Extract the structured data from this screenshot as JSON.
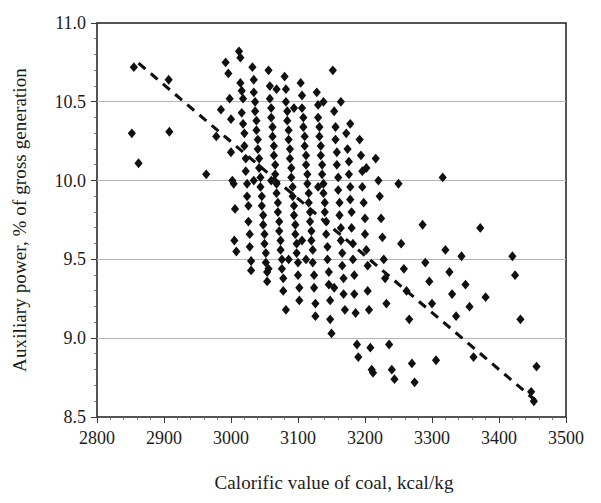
{
  "chart_data": {
    "type": "scatter",
    "title": "",
    "xlabel": "Calorific value of coal, kcal/kg",
    "ylabel": "Auxiliary power, % of gross generation",
    "xlim": [
      2800,
      3500
    ],
    "ylim": [
      8.5,
      11.0
    ],
    "xticks": [
      2800,
      2900,
      3000,
      3100,
      3200,
      3300,
      3400,
      3500
    ],
    "xtick_labels": [
      "2800",
      "2900",
      "3000",
      "3100",
      "3200",
      "3300",
      "3400",
      "3500"
    ],
    "yticks": [
      8.5,
      9.0,
      9.5,
      10.0,
      10.5,
      11.0
    ],
    "ytick_labels": [
      "8.5",
      "9.0",
      "9.5",
      "10.0",
      "10.5",
      "11.0"
    ],
    "grid": "horizontal",
    "gridline_color": "#b5b5b5",
    "legend": "none",
    "marker_shape": "diamond",
    "marker_color": "#101010",
    "marker_size_px": 7,
    "trendline": {
      "style": "dashed",
      "color": "#101010",
      "x_start": 2862,
      "y_start": 10.745,
      "x_end": 3460,
      "y_end": 8.585
    },
    "series": [
      {
        "name": "Units",
        "points": [
          [
            2855,
            10.72
          ],
          [
            2852,
            10.3
          ],
          [
            2862,
            10.11
          ],
          [
            2907,
            10.64
          ],
          [
            2908,
            10.31
          ],
          [
            2963,
            10.04
          ],
          [
            2978,
            10.28
          ],
          [
            2985,
            10.45
          ],
          [
            2992,
            10.75
          ],
          [
            2996,
            10.68
          ],
          [
            2998,
            10.52
          ],
          [
            3000,
            10.39
          ],
          [
            3000,
            10.18
          ],
          [
            3002,
            10.0
          ],
          [
            3004,
            9.98
          ],
          [
            3006,
            9.82
          ],
          [
            3005,
            9.62
          ],
          [
            3008,
            9.55
          ],
          [
            3012,
            10.82
          ],
          [
            3014,
            10.78
          ],
          [
            3014,
            10.62
          ],
          [
            3016,
            10.57
          ],
          [
            3018,
            10.52
          ],
          [
            3016,
            10.43
          ],
          [
            3018,
            10.36
          ],
          [
            3020,
            10.3
          ],
          [
            3020,
            10.22
          ],
          [
            3022,
            10.14
          ],
          [
            3022,
            10.06
          ],
          [
            3024,
            9.98
          ],
          [
            3024,
            9.9
          ],
          [
            3026,
            9.84
          ],
          [
            3026,
            9.74
          ],
          [
            3028,
            9.66
          ],
          [
            3028,
            9.58
          ],
          [
            3030,
            9.49
          ],
          [
            3030,
            9.43
          ],
          [
            3032,
            10.72
          ],
          [
            3034,
            10.64
          ],
          [
            3034,
            10.56
          ],
          [
            3036,
            10.5
          ],
          [
            3036,
            10.44
          ],
          [
            3038,
            10.38
          ],
          [
            3038,
            10.32
          ],
          [
            3040,
            10.26
          ],
          [
            3040,
            10.2
          ],
          [
            3042,
            10.14
          ],
          [
            3042,
            10.08
          ],
          [
            3044,
            10.02
          ],
          [
            3044,
            9.96
          ],
          [
            3046,
            9.9
          ],
          [
            3046,
            9.84
          ],
          [
            3048,
            9.78
          ],
          [
            3048,
            9.72
          ],
          [
            3050,
            9.66
          ],
          [
            3050,
            9.6
          ],
          [
            3052,
            9.54
          ],
          [
            3052,
            9.48
          ],
          [
            3054,
            9.42
          ],
          [
            3054,
            9.36
          ],
          [
            3056,
            10.7
          ],
          [
            3058,
            10.6
          ],
          [
            3058,
            10.52
          ],
          [
            3060,
            10.46
          ],
          [
            3060,
            10.4
          ],
          [
            3062,
            10.34
          ],
          [
            3062,
            10.28
          ],
          [
            3064,
            10.22
          ],
          [
            3064,
            10.16
          ],
          [
            3066,
            10.1
          ],
          [
            3066,
            10.04
          ],
          [
            3068,
            9.98
          ],
          [
            3068,
            9.92
          ],
          [
            3070,
            9.86
          ],
          [
            3070,
            9.8
          ],
          [
            3072,
            9.74
          ],
          [
            3072,
            9.68
          ],
          [
            3074,
            9.62
          ],
          [
            3074,
            9.56
          ],
          [
            3076,
            9.5
          ],
          [
            3076,
            9.44
          ],
          [
            3078,
            9.38
          ],
          [
            3078,
            9.3
          ],
          [
            3080,
            10.66
          ],
          [
            3082,
            10.58
          ],
          [
            3082,
            10.5
          ],
          [
            3084,
            10.44
          ],
          [
            3084,
            10.38
          ],
          [
            3086,
            10.32
          ],
          [
            3086,
            10.26
          ],
          [
            3088,
            10.2
          ],
          [
            3088,
            10.14
          ],
          [
            3090,
            10.08
          ],
          [
            3090,
            10.02
          ],
          [
            3092,
            9.96
          ],
          [
            3092,
            9.9
          ],
          [
            3094,
            9.84
          ],
          [
            3094,
            9.78
          ],
          [
            3096,
            9.72
          ],
          [
            3096,
            9.66
          ],
          [
            3098,
            9.6
          ],
          [
            3098,
            9.54
          ],
          [
            3100,
            9.48
          ],
          [
            3100,
            9.4
          ],
          [
            3102,
            9.32
          ],
          [
            3102,
            9.24
          ],
          [
            3104,
            10.62
          ],
          [
            3106,
            10.54
          ],
          [
            3106,
            10.46
          ],
          [
            3108,
            10.4
          ],
          [
            3108,
            10.34
          ],
          [
            3110,
            10.28
          ],
          [
            3110,
            10.22
          ],
          [
            3112,
            10.16
          ],
          [
            3112,
            10.1
          ],
          [
            3114,
            10.04
          ],
          [
            3114,
            9.98
          ],
          [
            3116,
            9.92
          ],
          [
            3116,
            9.86
          ],
          [
            3118,
            9.8
          ],
          [
            3118,
            9.74
          ],
          [
            3120,
            9.68
          ],
          [
            3120,
            9.62
          ],
          [
            3122,
            9.56
          ],
          [
            3122,
            9.48
          ],
          [
            3124,
            9.4
          ],
          [
            3124,
            9.32
          ],
          [
            3126,
            9.22
          ],
          [
            3126,
            9.14
          ],
          [
            3128,
            10.56
          ],
          [
            3130,
            10.48
          ],
          [
            3130,
            10.4
          ],
          [
            3132,
            10.34
          ],
          [
            3132,
            10.28
          ],
          [
            3134,
            10.22
          ],
          [
            3134,
            10.16
          ],
          [
            3136,
            10.1
          ],
          [
            3136,
            10.04
          ],
          [
            3138,
            9.98
          ],
          [
            3138,
            9.92
          ],
          [
            3140,
            9.86
          ],
          [
            3140,
            9.8
          ],
          [
            3142,
            9.74
          ],
          [
            3142,
            9.66
          ],
          [
            3144,
            9.58
          ],
          [
            3144,
            9.5
          ],
          [
            3146,
            9.42
          ],
          [
            3146,
            9.34
          ],
          [
            3148,
            9.24
          ],
          [
            3148,
            9.12
          ],
          [
            3150,
            9.03
          ],
          [
            3152,
            10.7
          ],
          [
            3154,
            10.44
          ],
          [
            3156,
            10.34
          ],
          [
            3156,
            10.26
          ],
          [
            3158,
            10.18
          ],
          [
            3158,
            10.1
          ],
          [
            3160,
            10.02
          ],
          [
            3160,
            9.94
          ],
          [
            3162,
            9.86
          ],
          [
            3162,
            9.78
          ],
          [
            3164,
            9.7
          ],
          [
            3164,
            9.62
          ],
          [
            3166,
            9.54
          ],
          [
            3166,
            9.46
          ],
          [
            3168,
            9.38
          ],
          [
            3168,
            9.28
          ],
          [
            3170,
            9.18
          ],
          [
            3172,
            10.3
          ],
          [
            3174,
            10.2
          ],
          [
            3176,
            10.12
          ],
          [
            3176,
            10.04
          ],
          [
            3178,
            9.96
          ],
          [
            3178,
            9.88
          ],
          [
            3180,
            9.8
          ],
          [
            3180,
            9.7
          ],
          [
            3182,
            9.6
          ],
          [
            3182,
            9.5
          ],
          [
            3184,
            9.4
          ],
          [
            3184,
            9.28
          ],
          [
            3186,
            9.16
          ],
          [
            3188,
            8.96
          ],
          [
            3190,
            8.88
          ],
          [
            3192,
            10.26
          ],
          [
            3194,
            10.16
          ],
          [
            3196,
            10.06
          ],
          [
            3196,
            9.96
          ],
          [
            3198,
            9.86
          ],
          [
            3200,
            9.76
          ],
          [
            3200,
            9.66
          ],
          [
            3202,
            9.56
          ],
          [
            3204,
            9.46
          ],
          [
            3204,
            9.3
          ],
          [
            3206,
            9.18
          ],
          [
            3208,
            8.94
          ],
          [
            3210,
            8.8
          ],
          [
            3212,
            8.78
          ],
          [
            3216,
            10.14
          ],
          [
            3220,
            10.0
          ],
          [
            3222,
            9.9
          ],
          [
            3224,
            9.76
          ],
          [
            3226,
            9.64
          ],
          [
            3228,
            9.5
          ],
          [
            3230,
            9.38
          ],
          [
            3232,
            9.22
          ],
          [
            3236,
            8.96
          ],
          [
            3240,
            8.8
          ],
          [
            3244,
            8.74
          ],
          [
            3250,
            9.98
          ],
          [
            3254,
            9.6
          ],
          [
            3258,
            9.44
          ],
          [
            3262,
            9.3
          ],
          [
            3266,
            9.12
          ],
          [
            3270,
            8.84
          ],
          [
            3274,
            8.72
          ],
          [
            3286,
            9.72
          ],
          [
            3290,
            9.48
          ],
          [
            3296,
            9.36
          ],
          [
            3300,
            9.22
          ],
          [
            3306,
            8.86
          ],
          [
            3316,
            10.02
          ],
          [
            3320,
            9.56
          ],
          [
            3326,
            9.42
          ],
          [
            3330,
            9.28
          ],
          [
            3336,
            9.14
          ],
          [
            3344,
            9.52
          ],
          [
            3350,
            9.34
          ],
          [
            3356,
            9.2
          ],
          [
            3362,
            8.88
          ],
          [
            3372,
            9.7
          ],
          [
            3380,
            9.26
          ],
          [
            3420,
            9.52
          ],
          [
            3424,
            9.4
          ],
          [
            3432,
            9.12
          ],
          [
            3448,
            8.66
          ],
          [
            3452,
            8.6
          ],
          [
            3456,
            8.82
          ],
          [
            3060,
            10.0
          ],
          [
            3086,
            9.5
          ],
          [
            3112,
            9.5
          ],
          [
            3138,
            10.5
          ],
          [
            3164,
            10.5
          ],
          [
            3068,
            10.58
          ],
          [
            3094,
            10.46
          ],
          [
            3034,
            10.0
          ],
          [
            3056,
            9.44
          ],
          [
            3082,
            9.18
          ],
          [
            3106,
            9.62
          ],
          [
            3130,
            9.96
          ],
          [
            3154,
            9.32
          ],
          [
            3178,
            10.36
          ],
          [
            3202,
            10.08
          ]
        ]
      }
    ]
  }
}
